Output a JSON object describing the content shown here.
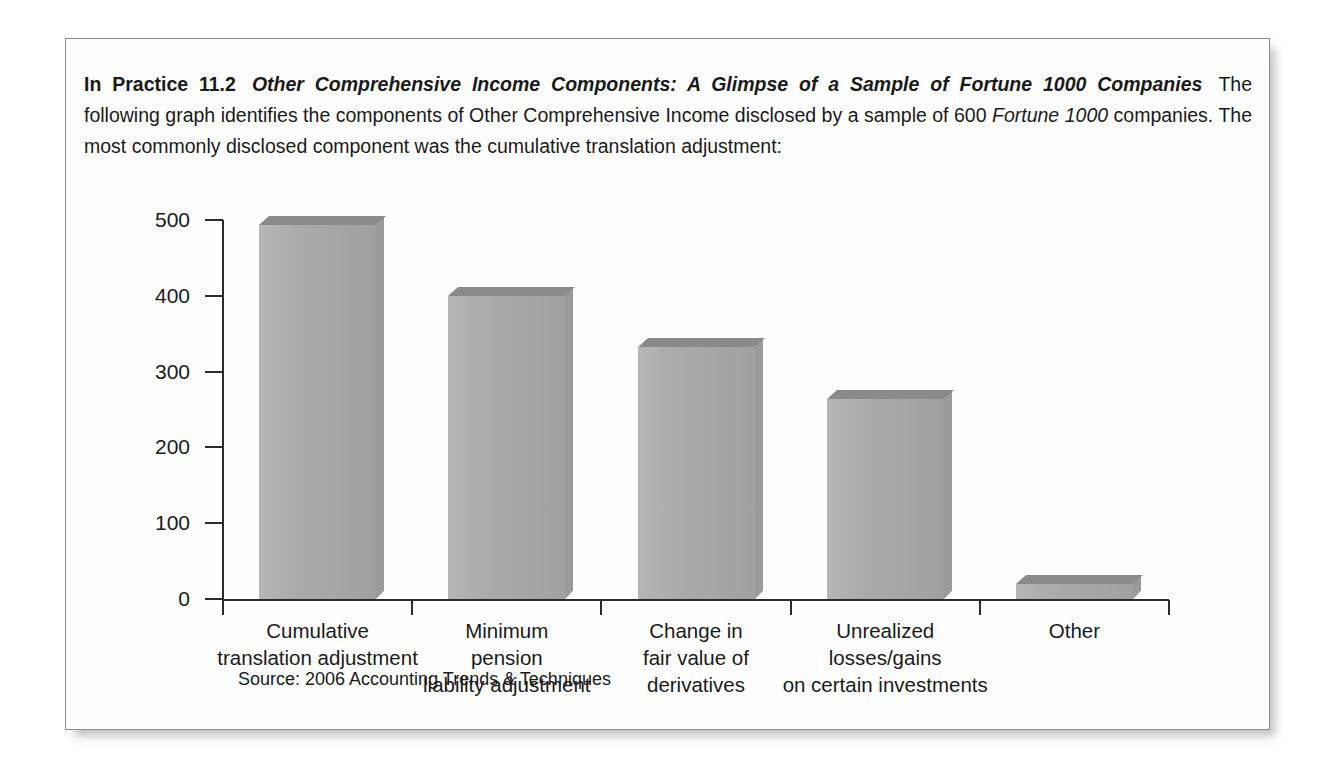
{
  "box": {
    "intro": {
      "label_bold": "In Practice 11.2",
      "title_bold_italic": "Other Comprehensive Income Components: A Glimpse of a Sample of Fortune 1000 Companies",
      "body_part1": "The following graph identifies the components of Other Comprehensive Income disclosed by a sample of 600 ",
      "body_italic": "Fortune 1000",
      "body_part2": " companies. The most commonly disclosed component was the cumulative translation adjustment:"
    },
    "source_note": "Source: 2006 Accounting Trends & Techniques"
  },
  "chart_data": {
    "type": "bar",
    "title": "Other Comprehensive Income Components: A Glimpse of a Sample of Fortune 1000 Companies",
    "xlabel": "",
    "ylabel": "",
    "ylim": [
      0,
      500
    ],
    "yticks": [
      0,
      100,
      200,
      300,
      400,
      500
    ],
    "ytick_labels": [
      "0",
      "100",
      "200",
      "300",
      "400",
      "500"
    ],
    "grid": false,
    "legend": "none",
    "bar_style": "3d-shaded",
    "colors": {
      "bar_front": "#a9a9a9",
      "bar_top": "#8a8a8a",
      "bar_side": "#9a9a9a",
      "axis": "#2b2b2b",
      "text": "#1a1a1a",
      "box_border": "#8d8d8d",
      "page_background": "#ffffff"
    },
    "categories": [
      "Cumulative\ntranslation adjustment",
      "Minimum\npension\nliability adjustment",
      "Change in\nfair value of\nderivatives",
      "Unrealized\nlosses/gains\non certain investments",
      "Other"
    ],
    "category_lines": [
      [
        "Cumulative",
        "translation adjustment"
      ],
      [
        "Minimum",
        "pension",
        "liability adjustment"
      ],
      [
        "Change in",
        "fair value of",
        "derivatives"
      ],
      [
        "Unrealized",
        "losses/gains",
        "on certain investments"
      ],
      [
        "Other"
      ]
    ],
    "values": [
      493,
      400,
      333,
      264,
      20
    ],
    "series": [
      {
        "name": "Number of companies disclosing component",
        "values": [
          493,
          400,
          333,
          264,
          20
        ]
      }
    ]
  }
}
